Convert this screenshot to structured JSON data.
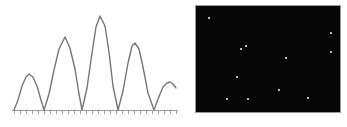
{
  "figure": {
    "panels": [
      {
        "id": "waveform",
        "role": "signal-plot"
      },
      {
        "id": "starfield",
        "role": "point-source-image"
      }
    ]
  },
  "chart_data": [
    {
      "type": "line",
      "id": "waveform",
      "title": "",
      "xlabel": "",
      "ylabel": "",
      "xlim": [
        0,
        176
      ],
      "ylim": [
        0,
        1
      ],
      "grid": false,
      "legend": null,
      "stroke_color": "#777777",
      "stroke_width": 1.4,
      "background": "#ffffff",
      "axis": {
        "baseline_y": 110,
        "axis_color": "#9a9a9a",
        "tick_count": 29,
        "tick_spacing_px": 6,
        "tick_length_px": 3,
        "tick_labels": []
      },
      "description": "Rectified sinc-like interference fringe profile: five lobes of unequal amplitude separated by zeros on the baseline.",
      "lobes": [
        {
          "index": 1,
          "peak_x": 29,
          "peak_y": 74,
          "amplitude": 0.33,
          "zero_left": 14,
          "zero_right": 44
        },
        {
          "index": 2,
          "peak_x": 65,
          "peak_y": 37,
          "amplitude": 0.7,
          "zero_left": 44,
          "zero_right": 82
        },
        {
          "index": 3,
          "peak_x": 100,
          "peak_y": 16,
          "amplitude": 1.0,
          "zero_left": 82,
          "zero_right": 118
        },
        {
          "index": 4,
          "peak_x": 135,
          "peak_y": 43,
          "amplitude": 0.64,
          "zero_left": 118,
          "zero_right": 154
        },
        {
          "index": 5,
          "peak_x": 170,
          "peak_y": 82,
          "amplitude": 0.27,
          "zero_left": 154,
          "zero_right": 176
        }
      ],
      "x": [
        14,
        18,
        22,
        26,
        29,
        33,
        37,
        41,
        44,
        49,
        54,
        59,
        65,
        70,
        75,
        79,
        82,
        87,
        92,
        96,
        100,
        105,
        109,
        113,
        118,
        123,
        128,
        132,
        135,
        139,
        143,
        148,
        154,
        158,
        163,
        167,
        170,
        173,
        176
      ],
      "y": [
        110,
        100,
        86,
        77,
        74,
        77,
        86,
        100,
        110,
        94,
        70,
        49,
        37,
        48,
        69,
        94,
        110,
        88,
        53,
        27,
        16,
        26,
        52,
        86,
        110,
        91,
        63,
        46,
        43,
        49,
        67,
        93,
        110,
        99,
        87,
        83,
        82,
        84,
        88
      ]
    },
    {
      "type": "scatter",
      "id": "starfield",
      "title": "",
      "xlabel": "",
      "ylabel": "",
      "grid": false,
      "legend": null,
      "background": "#050505",
      "border_color": "#9a9a9a",
      "marker_color": "#f2f2f2",
      "marker_size_px": 2,
      "panel_origin": [
        195,
        5
      ],
      "panel_size": [
        146,
        108
      ],
      "description": "Dark frame containing eleven unresolved white point sources.",
      "point_count": 11,
      "points": [
        {
          "x": 13,
          "y": 12
        },
        {
          "x": 135,
          "y": 27
        },
        {
          "x": 50,
          "y": 40
        },
        {
          "x": 135,
          "y": 46
        },
        {
          "x": 45,
          "y": 43
        },
        {
          "x": 90,
          "y": 52
        },
        {
          "x": 41,
          "y": 71
        },
        {
          "x": 83,
          "y": 84
        },
        {
          "x": 31,
          "y": 93
        },
        {
          "x": 52,
          "y": 93
        },
        {
          "x": 112,
          "y": 92
        }
      ]
    }
  ]
}
